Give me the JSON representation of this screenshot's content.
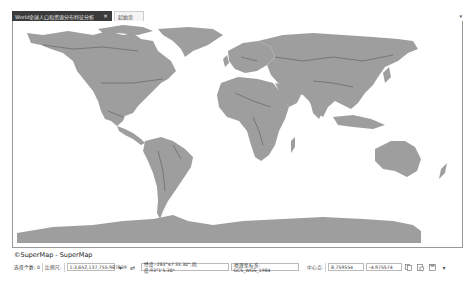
{
  "tabs": [
    {
      "label": "World全球人口和资源分布特征分析",
      "active": true,
      "close_icon": "×"
    },
    {
      "label": "起始页",
      "active": false
    }
  ],
  "tab_menu_icon": "▾",
  "map": {
    "land_color": "#9e9e9e",
    "border_color": "#3a3a3a",
    "ocean_color": "#ffffff",
    "copyright": "©SuperMap - SuperMap"
  },
  "statusbar": {
    "selection_label": "选择个数: 0",
    "scale_label": "比例尺:",
    "scale_value": "1:3,652,137,755.987839",
    "scale_dropdown_icon": "▾",
    "lock_icon": "⇄",
    "coords": "经度:-283°47'33.30\",纬度:93°1'5.30\"",
    "crs": "地理坐标系: GCS_WGS_1984",
    "center_label": "中心点:",
    "center_x": "8.759554",
    "center_y": "-4.975574",
    "icons": [
      "copy-icon",
      "paste-icon",
      "save-icon"
    ],
    "more_icon": "▾"
  }
}
